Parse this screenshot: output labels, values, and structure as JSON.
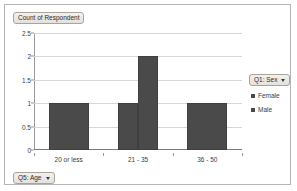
{
  "chart": {
    "title_badge": "Count of Respondent",
    "axis_field_button": "Q5: Age",
    "legend_field_button": "Q1: Sex",
    "caret_icon": "chevron-down-icon",
    "bar_color": "#4a4a4a",
    "gridline_color": "#d6d6d6",
    "frame_border_color": "#b5b5b5"
  },
  "chart_data": {
    "type": "bar",
    "title": "Count of Respondent",
    "xlabel": "Q5: Age",
    "ylabel": "",
    "categories": [
      "20 or less",
      "21 - 35",
      "36 - 50"
    ],
    "series": [
      {
        "name": "Female",
        "values": [
          1,
          1,
          1
        ]
      },
      {
        "name": "Male",
        "values": [
          0,
          2,
          0
        ]
      }
    ],
    "legend_title": "Q1: Sex",
    "legend_entries": [
      "Female",
      "Male"
    ],
    "legend_position": "right",
    "ylim": [
      0,
      2.5
    ],
    "yticks": [
      "0",
      "0.5",
      "1",
      "1.5",
      "2",
      "2.5"
    ],
    "ytick_values": [
      0,
      0.5,
      1,
      1.5,
      2,
      2.5
    ],
    "grid": true,
    "grid_axis": "y"
  }
}
